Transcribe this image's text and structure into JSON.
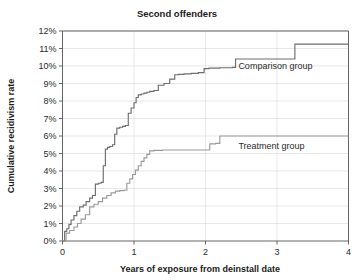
{
  "chart_data": {
    "type": "line",
    "title": "Second offenders",
    "xlabel": "Years of exposure from deinstall date",
    "ylabel": "Cumulative recidivism rate",
    "xlim": [
      0,
      4
    ],
    "ylim": [
      0,
      12
    ],
    "grid": true,
    "legend_position": "inline-annotation",
    "x_ticks": [
      0,
      1,
      2,
      3,
      4
    ],
    "x_tick_labels": [
      "0",
      "1",
      "2",
      "3",
      "4"
    ],
    "y_ticks": [
      0,
      1,
      2,
      3,
      4,
      5,
      6,
      7,
      8,
      9,
      10,
      11,
      12
    ],
    "y_tick_labels": [
      "0%",
      "1%",
      "2%",
      "3%",
      "4%",
      "5%",
      "6%",
      "7%",
      "8%",
      "9%",
      "10%",
      "11%",
      "12%"
    ],
    "series": [
      {
        "name": "Comparison group",
        "color": "#6e6e6e",
        "label_x": 2.46,
        "label_y": 10.0,
        "step": "post",
        "x": [
          0.0,
          0.03,
          0.06,
          0.09,
          0.12,
          0.16,
          0.2,
          0.24,
          0.29,
          0.33,
          0.38,
          0.42,
          0.46,
          0.5,
          0.54,
          0.57,
          0.6,
          0.63,
          0.66,
          0.7,
          0.73,
          0.76,
          0.8,
          0.84,
          0.88,
          0.92,
          0.96,
          1.0,
          1.03,
          1.06,
          1.1,
          1.14,
          1.18,
          1.22,
          1.28,
          1.34,
          1.42,
          1.5,
          1.57,
          1.62,
          1.7,
          1.8,
          1.9,
          1.98,
          2.05,
          2.2,
          2.38,
          2.42,
          2.8,
          3.2,
          3.25,
          3.6,
          4.0
        ],
        "y": [
          0.0,
          0.55,
          0.7,
          0.95,
          1.2,
          1.45,
          1.7,
          1.95,
          2.05,
          2.25,
          2.45,
          2.6,
          3.25,
          3.3,
          3.35,
          4.3,
          5.25,
          5.35,
          5.4,
          5.5,
          6.1,
          6.45,
          6.5,
          6.55,
          6.6,
          7.3,
          7.6,
          7.9,
          8.2,
          8.35,
          8.4,
          8.45,
          8.5,
          8.55,
          8.6,
          8.9,
          9.0,
          9.25,
          9.5,
          9.52,
          9.55,
          9.58,
          9.62,
          9.85,
          9.88,
          9.9,
          9.92,
          10.4,
          10.4,
          10.4,
          11.25,
          11.25,
          11.25
        ]
      },
      {
        "name": "Treatment group",
        "color": "#9a9a9a",
        "label_x": 2.46,
        "label_y": 5.45,
        "step": "post",
        "x": [
          0.0,
          0.05,
          0.1,
          0.16,
          0.21,
          0.26,
          0.32,
          0.38,
          0.44,
          0.5,
          0.56,
          0.62,
          0.68,
          0.74,
          0.8,
          0.86,
          0.9,
          0.94,
          0.98,
          1.02,
          1.06,
          1.1,
          1.14,
          1.18,
          1.22,
          1.28,
          1.4,
          1.6,
          1.8,
          1.95,
          2.02,
          2.06,
          2.14,
          2.2,
          2.6,
          3.0,
          3.5,
          4.0
        ],
        "y": [
          0.0,
          0.45,
          0.6,
          0.8,
          1.0,
          1.25,
          1.5,
          1.95,
          2.1,
          2.25,
          2.45,
          2.6,
          2.75,
          2.85,
          2.88,
          2.9,
          3.3,
          3.55,
          3.8,
          4.05,
          4.3,
          4.55,
          4.75,
          4.95,
          5.15,
          5.18,
          5.2,
          5.2,
          5.2,
          5.2,
          5.2,
          5.55,
          5.58,
          6.0,
          6.0,
          6.0,
          6.0,
          6.0
        ]
      }
    ]
  }
}
